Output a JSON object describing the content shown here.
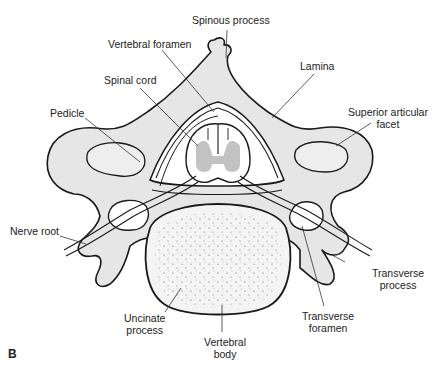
{
  "figure": {
    "panel_letter": "B",
    "colors": {
      "bone": "#e6e6e6",
      "outline": "#1a1a1a",
      "gray_matter": "#c2c2c2",
      "background": "#ffffff"
    }
  },
  "labels": {
    "spinous_process": "Spinous process",
    "vertebral_foramen": "Vertebral foramen",
    "lamina": "Lamina",
    "spinal_cord": "Spinal cord",
    "pedicle": "Pedicle",
    "superior_articular_facet_1": "Superior articular",
    "superior_articular_facet_2": "facet",
    "nerve_root": "Nerve root",
    "transverse_process_1": "Transverse",
    "transverse_process_2": "process",
    "uncinate_process_1": "Uncinate",
    "uncinate_process_2": "process",
    "transverse_foramen_1": "Transverse",
    "transverse_foramen_2": "foramen",
    "vertebral_body_1": "Vertebral",
    "vertebral_body_2": "body"
  }
}
